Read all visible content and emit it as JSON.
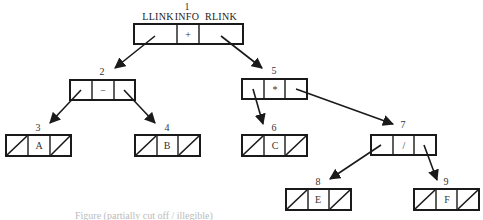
{
  "diagram": {
    "field_headers": {
      "llink": "LLINK",
      "info": "INFO",
      "rlink": "RLINK"
    },
    "nodes": [
      {
        "id": "1",
        "info": "+",
        "llink": "2",
        "rlink": "5"
      },
      {
        "id": "2",
        "info": "−",
        "llink": "3",
        "rlink": "4"
      },
      {
        "id": "3",
        "info": "A",
        "llink": null,
        "rlink": null
      },
      {
        "id": "4",
        "info": "B",
        "llink": null,
        "rlink": null
      },
      {
        "id": "5",
        "info": "*",
        "llink": "6",
        "rlink": "7"
      },
      {
        "id": "6",
        "info": "C",
        "llink": null,
        "rlink": null
      },
      {
        "id": "7",
        "info": "/",
        "llink": "8",
        "rlink": "9"
      },
      {
        "id": "8",
        "info": "E",
        "llink": null,
        "rlink": null
      },
      {
        "id": "9",
        "info": "F",
        "llink": null,
        "rlink": null
      }
    ],
    "edges": [
      {
        "from": "1",
        "to": "2",
        "via": "LLINK"
      },
      {
        "from": "1",
        "to": "5",
        "via": "RLINK"
      },
      {
        "from": "2",
        "to": "3",
        "via": "LLINK"
      },
      {
        "from": "2",
        "to": "4",
        "via": "RLINK"
      },
      {
        "from": "5",
        "to": "6",
        "via": "LLINK"
      },
      {
        "from": "5",
        "to": "7",
        "via": "RLINK"
      },
      {
        "from": "7",
        "to": "8",
        "via": "LLINK"
      },
      {
        "from": "7",
        "to": "9",
        "via": "RLINK"
      }
    ],
    "caption": "Figure (partially cut off / illegible)"
  }
}
